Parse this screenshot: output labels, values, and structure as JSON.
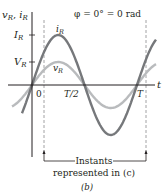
{
  "title": "φ = 0° = 0 rad",
  "axes": {
    "y_label_v": "v",
    "y_label_v_sub": "R",
    "y_label_i": "i",
    "y_label_i_sub": "R",
    "x_label": "t",
    "y_ticks": [
      {
        "label": "I",
        "sub": "R"
      },
      {
        "label": "V",
        "sub": "R"
      }
    ],
    "x_ticks": [
      "0",
      "T/2",
      "T"
    ]
  },
  "curves": {
    "current": {
      "label": "i",
      "sub": "R",
      "color": "#76787b"
    },
    "voltage": {
      "label": "v",
      "sub": "R",
      "color": "#b9bbbd"
    }
  },
  "annotation": {
    "line1": "Instants",
    "line2": "represented in (c)"
  },
  "caption": "(b)",
  "chart_data": {
    "type": "line",
    "title": "φ = 0° = 0 rad",
    "xlabel": "t",
    "ylabel": "vR, iR",
    "x_ticks": [
      "0",
      "T/2",
      "T"
    ],
    "y_ticks": [
      "VR",
      "IR"
    ],
    "series": [
      {
        "name": "iR",
        "function": "IR·sin(2πt/T)",
        "relative_amplitude": 1.0
      },
      {
        "name": "vR",
        "function": "VR·sin(2πt/T)",
        "relative_amplitude": 0.46
      }
    ],
    "phase_deg": 0,
    "x_range": [
      "-0.25T",
      "1.15T"
    ],
    "annotation": "Instants represented in (c)",
    "caption": "(b)"
  }
}
